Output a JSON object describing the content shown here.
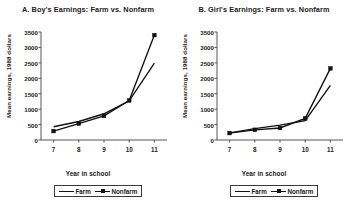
{
  "figure": {
    "background": "#ffffff",
    "line_color": "#111111",
    "axis_color": "#555555",
    "text_color": "#1a1a1a"
  },
  "panels": [
    {
      "id": "panel-a",
      "title": "A. Boy's Earnings: Farm vs. Nonfarm",
      "xlabel": "Year in school",
      "ylabel": "Mean earnings, 1988 dollars",
      "ytick_labels": [
        "3500",
        "3000",
        "2500",
        "2000",
        "1500",
        "1000",
        "500",
        "0"
      ],
      "xtick_labels": [
        "7",
        "8",
        "9",
        "10",
        "11"
      ],
      "legend": [
        {
          "label": "Farm",
          "marker": "none",
          "swatch": "line-swatch-icon"
        },
        {
          "label": "Nonfarm",
          "marker": "square",
          "swatch": "line-square-swatch-icon"
        }
      ]
    },
    {
      "id": "panel-b",
      "title": "B. Girl's Earnings: Farm vs. Nonfarm",
      "xlabel": "Year in school",
      "ylabel": "Mean earnings, 1988 dollars",
      "ytick_labels": [
        "3500",
        "3000",
        "2500",
        "2000",
        "1500",
        "1000",
        "500",
        "0"
      ],
      "xtick_labels": [
        "7",
        "8",
        "9",
        "10",
        "11"
      ],
      "legend": [
        {
          "label": "Farm",
          "marker": "none",
          "swatch": "line-swatch-icon"
        },
        {
          "label": "Nonfarm",
          "marker": "square",
          "swatch": "line-square-swatch-icon"
        }
      ]
    }
  ],
  "chart_data": [
    {
      "type": "line",
      "title": "A. Boy's Earnings: Farm vs. Nonfarm",
      "xlabel": "Year in school",
      "ylabel": "Mean earnings, 1988 dollars",
      "x": [
        7,
        8,
        9,
        10,
        11
      ],
      "categories": [
        "7",
        "8",
        "9",
        "10",
        "11"
      ],
      "xlim": [
        6.5,
        11.5
      ],
      "ylim": [
        0,
        3500
      ],
      "ytick_values": [
        0,
        500,
        1000,
        1500,
        2000,
        2500,
        3000,
        3500
      ],
      "grid": false,
      "legend_position": "below-axis-center",
      "series": [
        {
          "name": "Farm",
          "marker": "none",
          "values": [
            430,
            600,
            850,
            1270,
            2490
          ]
        },
        {
          "name": "Nonfarm",
          "marker": "square",
          "values": [
            290,
            530,
            780,
            1280,
            3400
          ]
        }
      ]
    },
    {
      "type": "line",
      "title": "B. Girl's Earnings: Farm vs. Nonfarm",
      "xlabel": "Year in school",
      "ylabel": "Mean earnings, 1988 dollars",
      "x": [
        7,
        8,
        9,
        10,
        11
      ],
      "categories": [
        "7",
        "8",
        "9",
        "10",
        "11"
      ],
      "xlim": [
        6.5,
        11.5
      ],
      "ylim": [
        0,
        3500
      ],
      "ytick_values": [
        0,
        500,
        1000,
        1500,
        2000,
        2500,
        3000,
        3500
      ],
      "grid": false,
      "legend_position": "below-axis-center",
      "series": [
        {
          "name": "Farm",
          "marker": "none",
          "values": [
            230,
            370,
            480,
            630,
            1770
          ]
        },
        {
          "name": "Nonfarm",
          "marker": "square",
          "values": [
            225,
            330,
            390,
            700,
            2320
          ]
        }
      ]
    }
  ]
}
